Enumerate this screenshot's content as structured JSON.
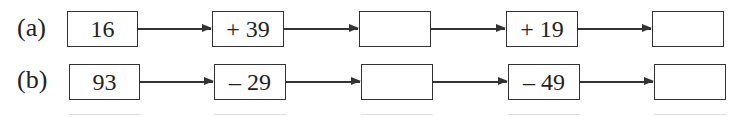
{
  "rows": [
    {
      "label": "(a)",
      "start": "16",
      "op1": "+ 39",
      "blank1": "",
      "op2": "+ 19",
      "blank2": ""
    },
    {
      "label": "(b)",
      "start": "93",
      "op1": "– 29",
      "blank1": "",
      "op2": "– 49",
      "blank2": ""
    }
  ]
}
